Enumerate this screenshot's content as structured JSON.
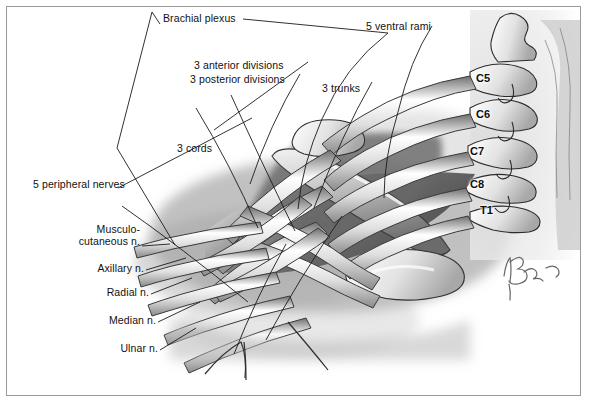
{
  "figure": {
    "kind": "anatomical-illustration",
    "subject": "Brachial plexus",
    "style": "grayscale medical line-and-tone drawing",
    "border_color": "#9a9a9a",
    "background": "#ffffff",
    "ink_color": "#111111"
  },
  "region_labels": [
    {
      "id": "brachial-plexus",
      "text": "Brachial plexus",
      "x": 163,
      "y": 19
    },
    {
      "id": "ventral-rami",
      "text": "5 ventral rami",
      "x": 366,
      "y": 27
    },
    {
      "id": "anterior-divisions",
      "text": "3 anterior divisions",
      "x": 194,
      "y": 65
    },
    {
      "id": "posterior-divisions",
      "text": "3 posterior divisions",
      "x": 190,
      "y": 79
    },
    {
      "id": "trunks",
      "text": "3 trunks",
      "x": 322,
      "y": 88
    },
    {
      "id": "cords",
      "text": "3 cords",
      "x": 177,
      "y": 148
    },
    {
      "id": "peripheral-nerves",
      "text": "5 peripheral nerves",
      "x": 33,
      "y": 184
    }
  ],
  "nerve_labels": [
    {
      "id": "musculocutaneous",
      "line1": "Musculo-",
      "line2": "cutaneous n.",
      "x": 65,
      "y": 229
    },
    {
      "id": "axillary",
      "line1": "Axillary n.",
      "line2": "",
      "x": 86,
      "y": 268
    },
    {
      "id": "radial",
      "line1": "Radial n.",
      "line2": "",
      "x": 102,
      "y": 292
    },
    {
      "id": "median",
      "line1": "Median n.",
      "line2": "",
      "x": 109,
      "y": 320
    },
    {
      "id": "ulnar",
      "line1": "Ulnar n.",
      "line2": "",
      "x": 118,
      "y": 348
    }
  ],
  "vertebra_labels": [
    {
      "id": "c5",
      "text": "C5",
      "x": 476,
      "y": 79
    },
    {
      "id": "c6",
      "text": "C6",
      "x": 476,
      "y": 115
    },
    {
      "id": "c7",
      "text": "C7",
      "x": 470,
      "y": 152
    },
    {
      "id": "c8",
      "text": "C8",
      "x": 470,
      "y": 185
    },
    {
      "id": "t1",
      "text": "T1",
      "x": 480,
      "y": 211
    }
  ],
  "signature": {
    "id": "artist-signature",
    "present": true,
    "x": 505,
    "y": 268
  }
}
